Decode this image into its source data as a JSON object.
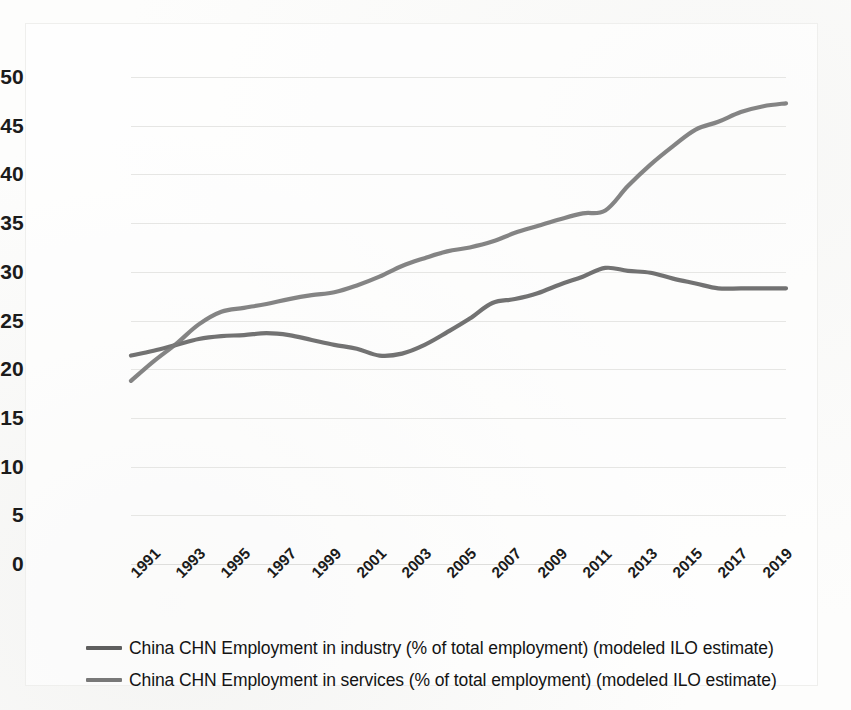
{
  "chart_data": {
    "type": "line",
    "title": "",
    "xlabel": "",
    "ylabel": "",
    "ylim": [
      0,
      50
    ],
    "ytick_step": 5,
    "yticks": [
      "0",
      "5",
      "10",
      "15",
      "20",
      "25",
      "30",
      "35",
      "40",
      "45",
      "50"
    ],
    "grid": true,
    "legend_position": "bottom",
    "x": [
      1991,
      1992,
      1993,
      1994,
      1995,
      1996,
      1997,
      1998,
      1999,
      2000,
      2001,
      2002,
      2003,
      2004,
      2005,
      2006,
      2007,
      2008,
      2009,
      2010,
      2011,
      2012,
      2013,
      2014,
      2015,
      2016,
      2017,
      2018,
      2019,
      2020
    ],
    "xtick_labels": [
      "1991",
      "1993",
      "1995",
      "1997",
      "1999",
      "2001",
      "2003",
      "2005",
      "2007",
      "2009",
      "2011",
      "2013",
      "2015",
      "2017",
      "2019"
    ],
    "series": [
      {
        "name": "China CHN Employment in industry (% of total employment) (modeled ILO estimate)",
        "color": "#666666",
        "values": [
          21.4,
          21.9,
          22.5,
          23.1,
          23.4,
          23.5,
          23.7,
          23.5,
          23.0,
          22.5,
          22.1,
          21.4,
          21.6,
          22.5,
          23.8,
          25.2,
          26.8,
          27.2,
          27.8,
          28.7,
          29.5,
          30.4,
          30.1,
          29.9,
          29.3,
          28.8,
          28.3,
          28.3,
          28.3,
          28.3
        ]
      },
      {
        "name": "China CHN Employment in services (% of total employment) (modeled ILO estimate)",
        "color": "#7a7a7a",
        "values": [
          18.8,
          20.8,
          22.6,
          24.6,
          25.9,
          26.3,
          26.7,
          27.2,
          27.6,
          27.9,
          28.6,
          29.5,
          30.6,
          31.4,
          32.1,
          32.5,
          33.1,
          34.0,
          34.7,
          35.4,
          36.0,
          36.3,
          38.8,
          41.0,
          42.9,
          44.6,
          45.4,
          46.4,
          47.0,
          47.3
        ]
      }
    ]
  },
  "legend": {
    "items": [
      {
        "label": "China CHN Employment in industry (% of total employment) (modeled ILO estimate)",
        "color": "#5e5e5e"
      },
      {
        "label": "China CHN Employment in services (% of total employment) (modeled ILO estimate)",
        "color": "#787878"
      }
    ]
  }
}
